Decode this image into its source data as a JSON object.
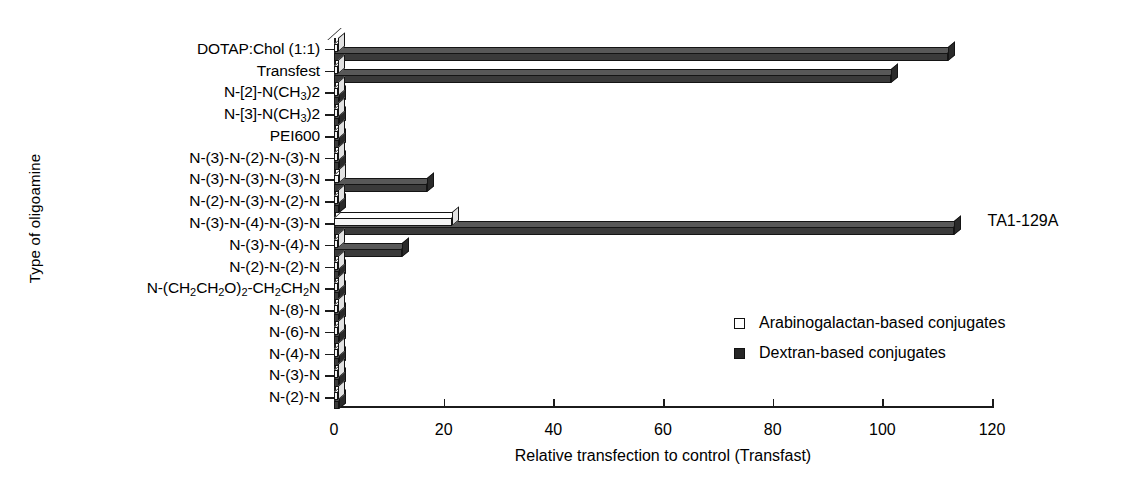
{
  "chart_data": {
    "type": "bar",
    "orientation": "horizontal",
    "title": "",
    "xlabel": "Relative transfection to control (Transfast)",
    "ylabel": "Type of oligoamine",
    "xlim": [
      0,
      120
    ],
    "xticks": [
      0,
      20,
      40,
      60,
      80,
      100,
      120
    ],
    "grid": false,
    "legend_position": "inside-right-lower",
    "categories": [
      "DOTAP:Chol (1:1)",
      "Transfest",
      "N-[2]-N(CH3)2",
      "N-[3]-N(CH3)2",
      "PEI600",
      "N-(3)-N-(2)-N-(3)-N",
      "N-(3)-N-(3)-N-(3)-N",
      "N-(2)-N-(3)-N-(2)-N",
      "N-(3)-N-(4)-N-(3)-N",
      "N-(3)-N-(4)-N",
      "N-(2)-N-(2)-N",
      "N-(CH2CH2O)2-CH2CH2N",
      "N-(8)-N",
      "N-(6)-N",
      "N-(4)-N",
      "N-(3)-N",
      "N-(2)-N"
    ],
    "series": [
      {
        "name": "Arabinogalactan-based conjugates",
        "color": "#ffffff",
        "values": [
          0,
          0,
          0.8,
          0.8,
          0.8,
          0.8,
          0.9,
          0.8,
          21.5,
          0.8,
          0.8,
          0.8,
          0.8,
          0.8,
          0.8,
          0.8,
          0.8
        ]
      },
      {
        "name": "Dextran-based conjugates",
        "color": "#262626",
        "values": [
          112,
          101.5,
          1.0,
          1.0,
          1.0,
          1.0,
          17.0,
          1.0,
          113,
          12.4,
          1.0,
          1.0,
          1.0,
          1.0,
          1.0,
          1.0,
          1.0
        ]
      }
    ],
    "annotations": [
      {
        "text": "TA1-129A",
        "category": "N-(3)-N-(4)-N-(3)-N",
        "x": 117
      }
    ]
  },
  "legend": {
    "items": [
      {
        "label": "Arabinogalactan-based conjugates",
        "swatch": "open-square"
      },
      {
        "label": "Dextran-based conjugates",
        "swatch": "filled-square"
      }
    ]
  },
  "axes": {
    "x_title": "Relative transfection to control (Transfast)",
    "y_title": "Type of oligoamine",
    "x_tick_labels": [
      "0",
      "20",
      "40",
      "60",
      "80",
      "100",
      "120"
    ]
  }
}
